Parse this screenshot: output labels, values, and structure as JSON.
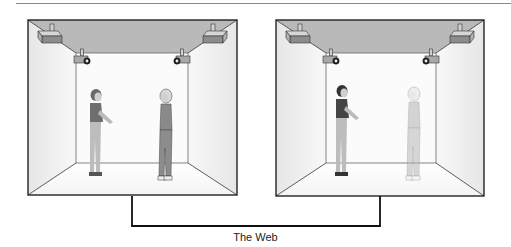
{
  "diagram": {
    "caption": "The Web",
    "colors": {
      "ceiling": "#b8b8b8",
      "wall": "#f2f2f2",
      "back_wall": "#fafafa",
      "outline": "#222222",
      "connector": "#111111",
      "device": "#9a9a9a",
      "device_dark": "#555555",
      "person_shirt": "#6e6e6e",
      "person_pants": "#bdbdbd",
      "person_dark_shirt": "#444444",
      "person_light": "#c8c8c8",
      "person_mid": "#8a8a8a"
    },
    "rooms": [
      {
        "name": "left-room",
        "people": [
          {
            "role": "local-woman-gesturing",
            "rendering": "solid"
          },
          {
            "role": "remote-woman-standing",
            "rendering": "solid"
          }
        ],
        "devices": [
          "projector-left",
          "projector-right",
          "camera-left",
          "camera-right"
        ]
      },
      {
        "name": "right-room",
        "people": [
          {
            "role": "local-woman-gesturing",
            "rendering": "solid"
          },
          {
            "role": "remote-woman-standing",
            "rendering": "projected"
          }
        ],
        "devices": [
          "projector-left",
          "projector-right",
          "camera-left",
          "camera-right"
        ]
      }
    ],
    "connection": {
      "label": "The Web"
    }
  }
}
